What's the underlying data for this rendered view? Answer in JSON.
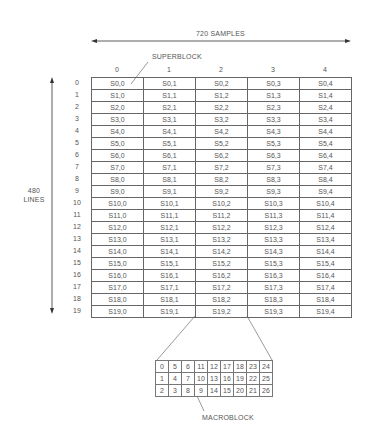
{
  "labels": {
    "samples": "720 SAMPLES",
    "lines_1": "480",
    "lines_2": "LINES",
    "superblock": "SUPERBLOCK",
    "macroblock": "MACROBLOCK"
  },
  "superblock_grid": {
    "column_headers": [
      "0",
      "1",
      "2",
      "3",
      "4"
    ],
    "row_headers": [
      "0",
      "1",
      "2",
      "3",
      "4",
      "5",
      "6",
      "7",
      "8",
      "9",
      "10",
      "11",
      "12",
      "13",
      "14",
      "15",
      "16",
      "17",
      "18",
      "19"
    ],
    "rows": [
      [
        "S0,0",
        "S0,1",
        "S0,2",
        "S0,3",
        "S0,4"
      ],
      [
        "S1,0",
        "S1,1",
        "S1,2",
        "S1,3",
        "S1,4"
      ],
      [
        "S2,0",
        "S2,1",
        "S2,2",
        "S2,3",
        "S2,4"
      ],
      [
        "S3,0",
        "S3,1",
        "S3,2",
        "S3,3",
        "S3,4"
      ],
      [
        "S4,0",
        "S4,1",
        "S4,2",
        "S4,3",
        "S4,4"
      ],
      [
        "S5,0",
        "S5,1",
        "S5,2",
        "S5,3",
        "S5,4"
      ],
      [
        "S6,0",
        "S6,1",
        "S6,2",
        "S6,3",
        "S6,4"
      ],
      [
        "S7,0",
        "S7,1",
        "S7,2",
        "S7,3",
        "S7,4"
      ],
      [
        "S8,0",
        "S8,1",
        "S8,2",
        "S8,3",
        "S8,4"
      ],
      [
        "S9,0",
        "S9,1",
        "S9,2",
        "S9,3",
        "S9,4"
      ],
      [
        "S10,0",
        "S10,1",
        "S10,2",
        "S10,3",
        "S10,4"
      ],
      [
        "S11,0",
        "S11,1",
        "S11,2",
        "S11,3",
        "S11,4"
      ],
      [
        "S12,0",
        "S12,1",
        "S12,2",
        "S12,3",
        "S12,4"
      ],
      [
        "S13,0",
        "S13,1",
        "S13,2",
        "S13,3",
        "S13,4"
      ],
      [
        "S14,0",
        "S14,1",
        "S14,2",
        "S14,3",
        "S14,4"
      ],
      [
        "S15,0",
        "S15,1",
        "S15,2",
        "S15,3",
        "S15,4"
      ],
      [
        "S16,0",
        "S16,1",
        "S16,2",
        "S16,3",
        "S16,4"
      ],
      [
        "S17,0",
        "S17,1",
        "S17,2",
        "S17,3",
        "S17,4"
      ],
      [
        "S18,0",
        "S18,1",
        "S18,2",
        "S18,3",
        "S18,4"
      ],
      [
        "S19,0",
        "S19,1",
        "S19,2",
        "S19,3",
        "S19,4"
      ]
    ]
  },
  "macroblock_grid": {
    "rows": [
      [
        "0",
        "5",
        "6",
        "11",
        "12",
        "17",
        "18",
        "23",
        "24"
      ],
      [
        "1",
        "4",
        "7",
        "10",
        "13",
        "16",
        "19",
        "22",
        "25"
      ],
      [
        "2",
        "3",
        "8",
        "9",
        "14",
        "15",
        "20",
        "21",
        "26"
      ]
    ]
  }
}
